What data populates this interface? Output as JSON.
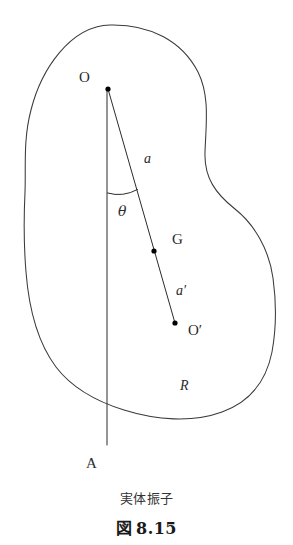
{
  "figure": {
    "caption_title": "実体振子",
    "caption_prefix": "図",
    "caption_number": "8.15",
    "stroke_color": "#3a3a3a",
    "line_color": "#2b2b2b",
    "background_color": "#ffffff"
  },
  "labels": {
    "pivot": "O",
    "rod_upper": "a",
    "angle": "θ",
    "center_of_mass": "G",
    "rod_lower": "a′",
    "center_of_oscillation": "O′",
    "body": "R",
    "vertical_axis_end": "A"
  },
  "diagram": {
    "points": [
      {
        "name": "pivot-O",
        "label": "O",
        "x": 108,
        "y": 89
      },
      {
        "name": "center-of-mass-G",
        "label": "G",
        "x": 154,
        "y": 251
      },
      {
        "name": "center-of-oscillation-O-prime",
        "label": "O′",
        "x": 175,
        "y": 323
      }
    ],
    "segments": [
      {
        "name": "rod-O-to-O-prime",
        "from": "pivot-O",
        "to": "center-of-oscillation-O-prime"
      },
      {
        "name": "vertical-axis-O-to-A",
        "from": "pivot-O",
        "to_x": 107,
        "to_y": 445
      }
    ],
    "angle_arc": {
      "name": "theta-arc",
      "vertex_x": 108,
      "vertex_y": 89,
      "radius": 104
    }
  }
}
